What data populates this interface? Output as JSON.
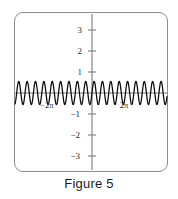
{
  "figure": {
    "caption": "Figure 5",
    "frame": {
      "border_color": "#8d8d8d",
      "background": "#ffffff"
    }
  },
  "axes": {
    "color": "#7a7a7a",
    "x_axis_label": "",
    "y_axis_label": "",
    "y_ticks": [
      {
        "value": 3,
        "label": "3"
      },
      {
        "value": 2,
        "label": "2"
      },
      {
        "value": 1,
        "label": "1"
      },
      {
        "value": -1,
        "label": "−1"
      },
      {
        "value": -2,
        "label": "−2"
      },
      {
        "value": -3,
        "label": "−3"
      }
    ],
    "x_ticks": [
      {
        "value": -6.2832,
        "label": "−2π"
      },
      {
        "value": 6.2832,
        "label": "2π"
      }
    ]
  },
  "chart_data": {
    "type": "line",
    "title": "Figure 5",
    "xlabel": "",
    "ylabel": "",
    "xlim": [
      -12.566,
      12.566
    ],
    "ylim": [
      -3.8,
      3.8
    ],
    "grid": false,
    "legend": null,
    "annotations": [],
    "series": [
      {
        "name": "high-frequency sinusoid",
        "color": "#000000",
        "amplitude": 0.55,
        "cycles_per_2pi": 4.6,
        "description": "Dense sinusoidal oscillation of small amplitude centered on the x-axis, spanning the full width of the viewing window",
        "x": [
          -12.566,
          -11.938,
          -11.31,
          -10.681,
          -10.053,
          -9.425,
          -8.796,
          -8.168,
          -7.54,
          -6.912,
          -6.283,
          -5.655,
          -5.027,
          -4.398,
          -3.77,
          -3.142,
          -2.513,
          -1.885,
          -1.257,
          -0.628,
          0,
          0.628,
          1.257,
          1.885,
          2.513,
          3.142,
          3.77,
          4.398,
          5.027,
          5.655,
          6.283,
          6.912,
          7.54,
          8.168,
          8.796,
          9.425,
          10.053,
          10.681,
          11.31,
          11.938,
          12.566
        ],
        "y": [
          0.55,
          -0.38,
          0.08,
          0.25,
          -0.52,
          0.49,
          -0.17,
          -0.2,
          0.5,
          -0.54,
          0.29,
          0.1,
          -0.44,
          0.55,
          -0.39,
          0.08,
          0.25,
          -0.52,
          0.49,
          -0.17,
          -0.2,
          0.5,
          -0.54,
          0.29,
          0.1,
          -0.44,
          0.55,
          -0.39,
          0.08,
          0.25,
          -0.52,
          0.49,
          -0.17,
          -0.2,
          0.5,
          -0.54,
          0.29,
          0.1,
          -0.44,
          0.55,
          -0.39
        ]
      }
    ]
  }
}
